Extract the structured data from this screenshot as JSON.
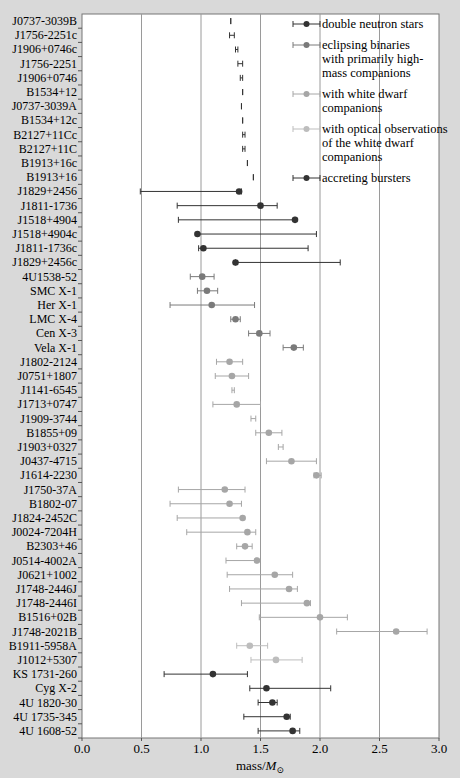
{
  "chart_data": {
    "type": "scatter",
    "subtype": "horizontal error-bar dot plot",
    "title": "",
    "xlabel": "mass/M⊙",
    "xlabel_main": "mass/",
    "xlabel_sym": "M",
    "xlabel_sub": "⊙",
    "ylabel": "",
    "xlim": [
      0.0,
      3.0
    ],
    "x_ticks": [
      "0.0",
      "0.5",
      "1.0",
      "1.5",
      "2.0",
      "2.5",
      "3.0"
    ],
    "x_tick_values": [
      0.0,
      0.5,
      1.0,
      1.5,
      2.0,
      2.5,
      3.0
    ],
    "grid": "vertical",
    "legend_position": "upper right (inside)",
    "colors": {
      "dns": "#333333",
      "eclipsing": "#7a7a7a",
      "wd": "#a6a6a6",
      "wd_optical": "#bdbdbd",
      "bursters": "#333333",
      "grid": "#9a9a9a",
      "plot_bg": "#ffffff",
      "page_bg": "#d9d9d9"
    },
    "legend": [
      {
        "key": "dns",
        "lines": [
          "double neutron stars"
        ]
      },
      {
        "key": "eclipsing",
        "lines": [
          "eclipsing binaries",
          "with primarily high-",
          "mass companions"
        ]
      },
      {
        "key": "wd",
        "lines": [
          "with white dwarf",
          "companions"
        ]
      },
      {
        "key": "wd_optical",
        "lines": [
          "with optical observations",
          "of the white dwarf",
          "companions"
        ]
      },
      {
        "key": "bursters",
        "lines": [
          "accreting bursters"
        ]
      }
    ],
    "points": [
      {
        "name": "J0737-3039B",
        "group": "dns",
        "mass": 1.25,
        "lo": 1.25,
        "hi": 1.25
      },
      {
        "name": "J1756-2251c",
        "group": "dns",
        "mass": 1.26,
        "lo": 1.24,
        "hi": 1.28
      },
      {
        "name": "J1906+0746c",
        "group": "dns",
        "mass": 1.3,
        "lo": 1.29,
        "hi": 1.31
      },
      {
        "name": "J1756-2251",
        "group": "dns",
        "mass": 1.33,
        "lo": 1.31,
        "hi": 1.35
      },
      {
        "name": "J1906+0746",
        "group": "dns",
        "mass": 1.34,
        "lo": 1.33,
        "hi": 1.35
      },
      {
        "name": "B1534+12",
        "group": "dns",
        "mass": 1.35,
        "lo": 1.35,
        "hi": 1.35
      },
      {
        "name": "J0737-3039A",
        "group": "dns",
        "mass": 1.34,
        "lo": 1.34,
        "hi": 1.34
      },
      {
        "name": "B1534+12c",
        "group": "dns",
        "mass": 1.35,
        "lo": 1.35,
        "hi": 1.35
      },
      {
        "name": "B2127+11Cc",
        "group": "dns",
        "mass": 1.36,
        "lo": 1.35,
        "hi": 1.37
      },
      {
        "name": "B2127+11C",
        "group": "dns",
        "mass": 1.36,
        "lo": 1.35,
        "hi": 1.37
      },
      {
        "name": "B1913+16c",
        "group": "dns",
        "mass": 1.39,
        "lo": 1.39,
        "hi": 1.39
      },
      {
        "name": "B1913+16",
        "group": "dns",
        "mass": 1.44,
        "lo": 1.44,
        "hi": 1.44
      },
      {
        "name": "J1829+2456",
        "group": "dns",
        "mass": 1.32,
        "lo": 0.49,
        "hi": 1.34
      },
      {
        "name": "J1811-1736",
        "group": "dns",
        "mass": 1.5,
        "lo": 0.8,
        "hi": 1.64
      },
      {
        "name": "J1518+4904",
        "group": "dns",
        "mass": 1.79,
        "lo": 0.81,
        "hi": 1.79
      },
      {
        "name": "J1518+4904c",
        "group": "dns",
        "mass": 0.97,
        "lo": 0.97,
        "hi": 1.97
      },
      {
        "name": "J1811-1736c",
        "group": "dns",
        "mass": 1.02,
        "lo": 0.98,
        "hi": 1.9
      },
      {
        "name": "J1829+2456c",
        "group": "dns",
        "mass": 1.29,
        "lo": 1.29,
        "hi": 2.17
      },
      {
        "name": "4U1538-52",
        "group": "eclipsing",
        "mass": 1.01,
        "lo": 0.91,
        "hi": 1.11
      },
      {
        "name": "SMC X-1",
        "group": "eclipsing",
        "mass": 1.05,
        "lo": 0.97,
        "hi": 1.14
      },
      {
        "name": "Her X-1",
        "group": "eclipsing",
        "mass": 1.09,
        "lo": 0.74,
        "hi": 1.45
      },
      {
        "name": "LMC X-4",
        "group": "eclipsing",
        "mass": 1.29,
        "lo": 1.25,
        "hi": 1.33
      },
      {
        "name": "Cen X-3",
        "group": "eclipsing",
        "mass": 1.49,
        "lo": 1.4,
        "hi": 1.58
      },
      {
        "name": "Vela X-1",
        "group": "eclipsing",
        "mass": 1.78,
        "lo": 1.69,
        "hi": 1.86
      },
      {
        "name": "J1802-2124",
        "group": "wd",
        "mass": 1.24,
        "lo": 1.13,
        "hi": 1.35
      },
      {
        "name": "J0751+1807",
        "group": "wd",
        "mass": 1.26,
        "lo": 1.12,
        "hi": 1.4
      },
      {
        "name": "J1141-6545",
        "group": "wd",
        "mass": 1.27,
        "lo": 1.26,
        "hi": 1.28
      },
      {
        "name": "J1713+0747",
        "group": "wd",
        "mass": 1.3,
        "lo": 1.1,
        "hi": 1.5
      },
      {
        "name": "J1909-3744",
        "group": "wd",
        "mass": 1.44,
        "lo": 1.42,
        "hi": 1.46
      },
      {
        "name": "B1855+09",
        "group": "wd",
        "mass": 1.57,
        "lo": 1.46,
        "hi": 1.68
      },
      {
        "name": "J1903+0327",
        "group": "wd",
        "mass": 1.67,
        "lo": 1.65,
        "hi": 1.69
      },
      {
        "name": "J0437-4715",
        "group": "wd",
        "mass": 1.76,
        "lo": 1.55,
        "hi": 1.97
      },
      {
        "name": "J1614-2230",
        "group": "wd",
        "mass": 1.97,
        "lo": 1.95,
        "hi": 2.01
      },
      {
        "name": "J1750-37A",
        "group": "wd",
        "mass": 1.2,
        "lo": 0.81,
        "hi": 1.37
      },
      {
        "name": "B1802-07",
        "group": "wd",
        "mass": 1.24,
        "lo": 0.74,
        "hi": 1.34
      },
      {
        "name": "J1824-2452C",
        "group": "wd",
        "mass": 1.35,
        "lo": 0.8,
        "hi": 1.35
      },
      {
        "name": "J0024-7204H",
        "group": "wd",
        "mass": 1.39,
        "lo": 0.88,
        "hi": 1.46
      },
      {
        "name": "B2303+46",
        "group": "wd",
        "mass": 1.37,
        "lo": 1.3,
        "hi": 1.43
      },
      {
        "name": "J0514-4002A",
        "group": "wd",
        "mass": 1.47,
        "lo": 1.21,
        "hi": 1.47
      },
      {
        "name": "J0621+1002",
        "group": "wd",
        "mass": 1.62,
        "lo": 1.22,
        "hi": 1.77
      },
      {
        "name": "J1748-2446J",
        "group": "wd",
        "mass": 1.74,
        "lo": 1.24,
        "hi": 1.81
      },
      {
        "name": "J1748-2446I",
        "group": "wd",
        "mass": 1.89,
        "lo": 1.34,
        "hi": 1.92
      },
      {
        "name": "B1516+02B",
        "group": "wd",
        "mass": 2.0,
        "lo": 1.49,
        "hi": 2.23
      },
      {
        "name": "J1748-2021B",
        "group": "wd",
        "mass": 2.64,
        "lo": 2.14,
        "hi": 2.9
      },
      {
        "name": "B1911-5958A",
        "group": "wd_optical",
        "mass": 1.41,
        "lo": 1.3,
        "hi": 1.56
      },
      {
        "name": "J1012+5307",
        "group": "wd_optical",
        "mass": 1.63,
        "lo": 1.42,
        "hi": 1.85
      },
      {
        "name": "KS 1731-260",
        "group": "bursters",
        "mass": 1.1,
        "lo": 0.69,
        "hi": 1.39
      },
      {
        "name": "Cyg X-2",
        "group": "bursters",
        "mass": 1.55,
        "lo": 1.41,
        "hi": 2.09
      },
      {
        "name": "4U 1820-30",
        "group": "bursters",
        "mass": 1.6,
        "lo": 1.48,
        "hi": 1.64
      },
      {
        "name": "4U 1735-345",
        "group": "bursters",
        "mass": 1.72,
        "lo": 1.36,
        "hi": 1.75
      },
      {
        "name": "4U 1608-52",
        "group": "bursters",
        "mass": 1.77,
        "lo": 1.48,
        "hi": 1.83
      }
    ]
  }
}
